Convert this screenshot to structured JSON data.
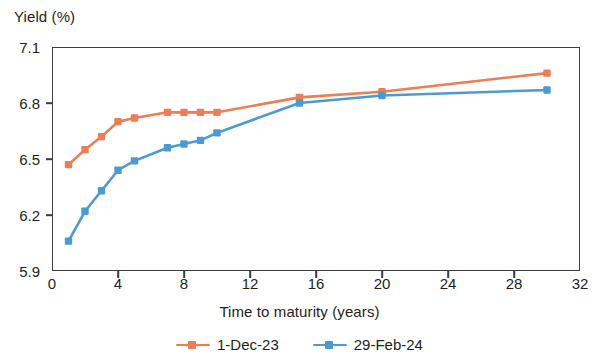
{
  "chart_data": {
    "type": "line",
    "title": "",
    "ylabel": "Yield (%)",
    "xlabel": "Time to maturity (years)",
    "xlim": [
      0,
      32
    ],
    "ylim": [
      5.9,
      7.1
    ],
    "xticks": [
      0,
      4,
      8,
      12,
      16,
      20,
      24,
      28,
      32
    ],
    "yticks": [
      5.9,
      6.2,
      6.5,
      6.8,
      7.1
    ],
    "ytick_labels": [
      "5.9",
      "6.2",
      "6.5",
      "6.8",
      "7.1"
    ],
    "xtick_labels": [
      "0",
      "4",
      "8",
      "12",
      "16",
      "20",
      "24",
      "28",
      "32"
    ],
    "grid": false,
    "legend_position": "bottom",
    "x": [
      1,
      2,
      3,
      4,
      5,
      7,
      8,
      9,
      10,
      15,
      20,
      30
    ],
    "series": [
      {
        "name": "1-Dec-23",
        "color": "#ED7D52",
        "marker": "square",
        "values": [
          6.47,
          6.55,
          6.62,
          6.7,
          6.72,
          6.75,
          6.75,
          6.75,
          6.75,
          6.83,
          6.86,
          6.96
        ]
      },
      {
        "name": "29-Feb-24",
        "color": "#4A9BD4",
        "marker": "square",
        "values": [
          6.06,
          6.22,
          6.33,
          6.44,
          6.49,
          6.56,
          6.58,
          6.6,
          6.64,
          6.8,
          6.84,
          6.87
        ]
      }
    ]
  },
  "legend": {
    "items": [
      {
        "label": "1-Dec-23",
        "color": "#ED7D52"
      },
      {
        "label": "29-Feb-24",
        "color": "#4A9BD4"
      }
    ]
  },
  "colors": {
    "series_1": "#ED7D52",
    "series_2": "#4A9BD4",
    "axis": "#3c3c3c",
    "text": "#231f20",
    "background": "#ffffff"
  }
}
